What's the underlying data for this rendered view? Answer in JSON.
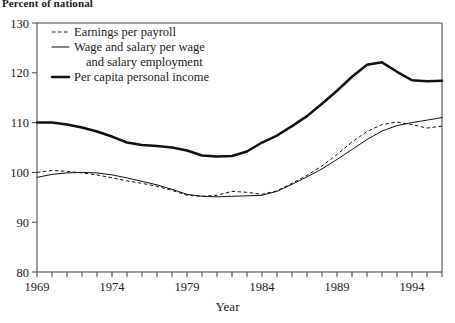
{
  "caption": {
    "unit_note": "Percent of national"
  },
  "axes": {
    "x_label": "Year",
    "x_ticks": [
      "1969",
      "1974",
      "1979",
      "1984",
      "1989",
      "1994"
    ],
    "x_tick_years": [
      1969,
      1974,
      1979,
      1984,
      1989,
      1994
    ],
    "y_ticks": [
      "80",
      "90",
      "100",
      "110",
      "120",
      "130"
    ],
    "y_min": 80,
    "y_max": 130,
    "x_min": 1969,
    "x_max": 1996
  },
  "legend": {
    "position": "top-left-inside",
    "items": [
      {
        "label": "Earnings per payroll",
        "style": "dashed"
      },
      {
        "label": "Wage and salary per wage",
        "label2": "and salary employment",
        "style": "thin-solid"
      },
      {
        "label": "Per capita personal income",
        "style": "thick-solid"
      }
    ]
  },
  "colors": {
    "ink": "#111111",
    "axis": "#3b3b3b",
    "background": "#ffffff"
  },
  "chart_data": {
    "type": "line",
    "title": "",
    "subtitle": "",
    "xlabel": "Year",
    "ylabel": "Percent of national",
    "xlim": [
      1969,
      1996
    ],
    "ylim": [
      80,
      130
    ],
    "grid": false,
    "legend_position": "upper left",
    "x": [
      1969,
      1970,
      1971,
      1972,
      1973,
      1974,
      1975,
      1976,
      1977,
      1978,
      1979,
      1980,
      1981,
      1982,
      1983,
      1984,
      1985,
      1986,
      1987,
      1988,
      1989,
      1990,
      1991,
      1992,
      1993,
      1994,
      1995,
      1996
    ],
    "series": [
      {
        "name": "Earnings per payroll",
        "style": "dashed",
        "values": [
          100.0,
          100.4,
          100.2,
          99.9,
          99.5,
          98.9,
          98.3,
          97.8,
          97.2,
          96.4,
          95.4,
          95.2,
          95.4,
          96.2,
          96.0,
          95.6,
          96.3,
          97.8,
          99.4,
          101.3,
          103.6,
          106.1,
          108.2,
          109.6,
          110.1,
          109.6,
          108.9,
          109.3
        ]
      },
      {
        "name": "Wage and salary per wage and salary employment",
        "style": "thin-solid",
        "values": [
          99.0,
          99.6,
          99.9,
          100.0,
          99.9,
          99.5,
          98.9,
          98.2,
          97.5,
          96.6,
          95.6,
          95.2,
          95.1,
          95.2,
          95.3,
          95.4,
          96.2,
          97.6,
          99.1,
          100.7,
          102.6,
          104.6,
          106.6,
          108.3,
          109.4,
          110.0,
          110.5,
          111.0
        ]
      },
      {
        "name": "Per capita personal income",
        "style": "thick-solid",
        "values": [
          110.0,
          110.0,
          109.6,
          109.0,
          108.2,
          107.2,
          106.0,
          105.5,
          105.3,
          105.0,
          104.4,
          103.4,
          103.2,
          103.3,
          104.2,
          106.0,
          107.4,
          109.3,
          111.3,
          113.8,
          116.4,
          119.2,
          121.6,
          122.1,
          120.2,
          118.5,
          118.3,
          118.4
        ]
      }
    ]
  }
}
